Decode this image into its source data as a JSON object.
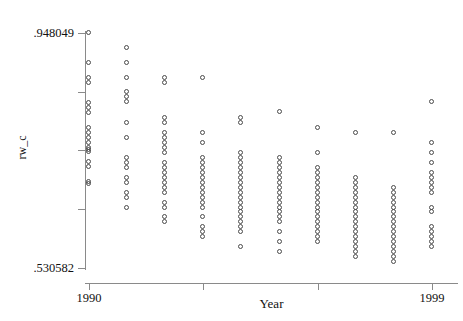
{
  "chart_data": {
    "type": "scatter",
    "title": "",
    "subtitle": "",
    "xlabel": "Year",
    "ylabel": "rw_c",
    "xlim": [
      1990,
      1999
    ],
    "ylim": [
      0.530582,
      0.948049
    ],
    "grid": false,
    "legend": null,
    "x_tick_labels": [
      "1990",
      "1999"
    ],
    "x_tick_values": [
      1990,
      1999
    ],
    "x_tick_marks": [
      1990,
      1993,
      1996,
      1999
    ],
    "y_tick_labels": [
      ".948049",
      ".530582"
    ],
    "y_tick_values": [
      0.948049,
      0.530582
    ],
    "y_tick_marks": [
      0.948049,
      0.843683,
      0.739316,
      0.634949,
      0.530582
    ],
    "marker": "open-circle",
    "marker_color": "#4a4a4a",
    "axis_color": "#8a8a8a",
    "series": [
      {
        "name": "rw_c",
        "points_by_year": [
          {
            "x": 1990,
            "values": [
              0.948,
              0.8952,
              0.8688,
              0.86,
              0.823,
              0.815,
              0.8053,
              0.779,
              0.77,
              0.7612,
              0.7524,
              0.7436,
              0.7395,
              0.736,
              0.7183,
              0.7096,
              0.6832,
              0.679
            ]
          },
          {
            "x": 1991,
            "values": [
              0.9218,
              0.8952,
              0.8688,
              0.8424,
              0.8336,
              0.8248,
              0.7876,
              0.7612,
              0.726,
              0.7172,
              0.7084,
              0.6908,
              0.682,
              0.6644,
              0.6556,
              0.638
            ]
          },
          {
            "x": 1992,
            "values": [
              0.8688,
              0.86,
              0.7964,
              0.7876,
              0.77,
              0.7612,
              0.7524,
              0.7436,
              0.7348,
              0.7172,
              0.7084,
              0.6996,
              0.6908,
              0.682,
              0.6732,
              0.6644,
              0.6468,
              0.638,
              0.6204,
              0.6116
            ]
          },
          {
            "x": 1993,
            "values": [
              0.8688,
              0.77,
              0.7524,
              0.726,
              0.7172,
              0.7084,
              0.6996,
              0.6908,
              0.682,
              0.6732,
              0.6644,
              0.6556,
              0.6468,
              0.638,
              0.6204,
              0.6028,
              0.594,
              0.5852
            ]
          },
          {
            "x": 1994,
            "values": [
              0.7964,
              0.7876,
              0.7348,
              0.726,
              0.7172,
              0.7084,
              0.6996,
              0.6908,
              0.682,
              0.6732,
              0.6644,
              0.6556,
              0.6468,
              0.638,
              0.6292,
              0.6204,
              0.6116,
              0.6028,
              0.594,
              0.5676
            ]
          },
          {
            "x": 1995,
            "values": [
              0.807,
              0.726,
              0.7172,
              0.7084,
              0.6996,
              0.6908,
              0.682,
              0.6732,
              0.6644,
              0.6556,
              0.6468,
              0.638,
              0.6292,
              0.6204,
              0.6116,
              0.594,
              0.5764,
              0.5588
            ]
          },
          {
            "x": 1996,
            "values": [
              0.7788,
              0.7348,
              0.7084,
              0.6996,
              0.6908,
              0.682,
              0.6732,
              0.6644,
              0.6556,
              0.6468,
              0.638,
              0.6292,
              0.6204,
              0.6116,
              0.6028,
              0.594,
              0.5852,
              0.5764
            ]
          },
          {
            "x": 1997,
            "values": [
              0.77,
              0.6908,
              0.682,
              0.6732,
              0.6644,
              0.6556,
              0.6468,
              0.638,
              0.6292,
              0.6204,
              0.6116,
              0.6028,
              0.594,
              0.5852,
              0.5764,
              0.5676,
              0.5588,
              0.55
            ]
          },
          {
            "x": 1998,
            "values": [
              0.77,
              0.6732,
              0.6644,
              0.6556,
              0.6468,
              0.638,
              0.6292,
              0.6204,
              0.6116,
              0.6028,
              0.594,
              0.5852,
              0.5764,
              0.5676,
              0.5588,
              0.55,
              0.5412
            ]
          },
          {
            "x": 1999,
            "values": [
              0.8248,
              0.7524,
              0.7348,
              0.7172,
              0.6996,
              0.6908,
              0.682,
              0.6732,
              0.6644,
              0.638,
              0.6292,
              0.6028,
              0.594,
              0.5852,
              0.5764,
              0.5676
            ]
          }
        ]
      }
    ]
  }
}
